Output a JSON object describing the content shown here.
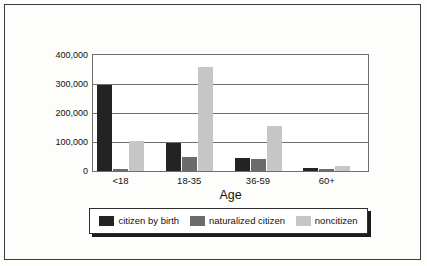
{
  "chart_data": {
    "type": "bar",
    "title": "",
    "xlabel": "Age",
    "ylabel": "",
    "categories": [
      "<18",
      "18-35",
      "36-59",
      "60+"
    ],
    "series": [
      {
        "name": "citizen by birth",
        "color": "#232323",
        "values": [
          297000,
          97000,
          45000,
          12000
        ]
      },
      {
        "name": "naturalized citizen",
        "color": "#6b6b6b",
        "values": [
          8000,
          48000,
          42000,
          6000
        ]
      },
      {
        "name": "noncitizen",
        "color": "#c6c6c6",
        "values": [
          103000,
          357000,
          155000,
          18000
        ]
      }
    ],
    "ylim": [
      0,
      400000
    ],
    "yticks": [
      0,
      100000,
      200000,
      300000,
      400000
    ],
    "ytick_labels": [
      "0",
      "100,000",
      "200,000",
      "300,000",
      "400,000"
    ],
    "grid": true,
    "legend_position": "bottom"
  }
}
